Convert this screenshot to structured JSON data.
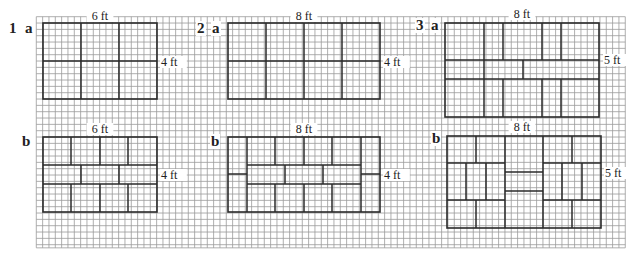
{
  "grid": {
    "x0": 36.3,
    "y0": 16.7,
    "cell": 6.333,
    "cols": 93,
    "rows": 36.5,
    "line_color": "#9a9a9a",
    "tile_color": "#2a2a2a"
  },
  "labels": [
    {
      "id": "q1",
      "text": "1",
      "x": 9,
      "y": 33,
      "cls": "num"
    },
    {
      "id": "q1a",
      "text": "a",
      "x": 25,
      "y": 33,
      "cls": "part"
    },
    {
      "id": "q1b",
      "text": "b",
      "x": 22,
      "y": 146,
      "cls": "part"
    },
    {
      "id": "q2",
      "text": "2",
      "x": 197,
      "y": 33,
      "cls": "num"
    },
    {
      "id": "q2a",
      "text": "a",
      "x": 212,
      "y": 33,
      "cls": "part"
    },
    {
      "id": "q2b",
      "text": "b",
      "x": 211,
      "y": 146,
      "cls": "part"
    },
    {
      "id": "q3",
      "text": "3",
      "x": 416,
      "y": 30,
      "cls": "num"
    },
    {
      "id": "q3a",
      "text": "a",
      "x": 431,
      "y": 30,
      "cls": "part"
    },
    {
      "id": "q3b",
      "text": "b",
      "x": 432,
      "y": 143,
      "cls": "part"
    }
  ],
  "dims": [
    {
      "id": "1a-width",
      "text": "6 ft",
      "x": 100,
      "y": 20,
      "anchor": "middle"
    },
    {
      "id": "1a-height",
      "text": "4 ft",
      "x": 161,
      "y": 66,
      "anchor": "start"
    },
    {
      "id": "1b-width",
      "text": "6 ft",
      "x": 100,
      "y": 133,
      "anchor": "middle"
    },
    {
      "id": "1b-height",
      "text": "4 ft",
      "x": 161,
      "y": 179,
      "anchor": "start"
    },
    {
      "id": "2a-width",
      "text": "8 ft",
      "x": 304,
      "y": 20,
      "anchor": "middle"
    },
    {
      "id": "2a-height",
      "text": "4 ft",
      "x": 384,
      "y": 66,
      "anchor": "start"
    },
    {
      "id": "2b-width",
      "text": "8 ft",
      "x": 304,
      "y": 133,
      "anchor": "middle"
    },
    {
      "id": "2b-height",
      "text": "4 ft",
      "x": 384,
      "y": 179,
      "anchor": "start"
    },
    {
      "id": "3a-width",
      "text": "8 ft",
      "x": 522,
      "y": 18,
      "anchor": "middle"
    },
    {
      "id": "3a-height",
      "text": "5 ft",
      "x": 604,
      "y": 64,
      "anchor": "start"
    },
    {
      "id": "3b-width",
      "text": "8 ft",
      "x": 522,
      "y": 131,
      "anchor": "middle"
    },
    {
      "id": "3b-height",
      "text": "5 ft",
      "x": 605,
      "y": 177,
      "anchor": "start"
    }
  ],
  "figures": [
    {
      "id": "1a",
      "outline": [
        43,
        23,
        157,
        99
      ],
      "lines": [
        [
          81,
          23,
          81,
          99
        ],
        [
          119,
          23,
          119,
          99
        ],
        [
          43,
          61,
          157,
          61
        ]
      ]
    },
    {
      "id": "1b",
      "outline": [
        43,
        137,
        157,
        212
      ],
      "lines": [
        [
          43,
          165,
          157,
          165
        ],
        [
          43,
          184,
          157,
          184
        ],
        [
          71,
          137,
          71,
          165
        ],
        [
          100,
          137,
          100,
          165
        ],
        [
          128,
          137,
          128,
          165
        ],
        [
          81,
          165,
          81,
          184
        ],
        [
          119,
          165,
          119,
          184
        ],
        [
          71,
          184,
          71,
          212
        ],
        [
          100,
          184,
          100,
          212
        ],
        [
          128,
          184,
          128,
          212
        ]
      ]
    },
    {
      "id": "2a",
      "outline": [
        228,
        23,
        380,
        99
      ],
      "lines": [
        [
          266,
          23,
          266,
          99
        ],
        [
          304,
          23,
          304,
          99
        ],
        [
          342,
          23,
          342,
          99
        ],
        [
          228,
          61,
          380,
          61
        ]
      ]
    },
    {
      "id": "2b",
      "outline": [
        228,
        137,
        380,
        212
      ],
      "lines": [
        [
          247,
          137,
          247,
          212
        ],
        [
          361,
          137,
          361,
          212
        ],
        [
          228,
          174,
          247,
          174
        ],
        [
          361,
          174,
          380,
          174
        ],
        [
          247,
          165,
          361,
          165
        ],
        [
          247,
          184,
          361,
          184
        ],
        [
          275,
          137,
          275,
          165
        ],
        [
          304,
          137,
          304,
          165
        ],
        [
          332,
          137,
          332,
          165
        ],
        [
          285,
          165,
          285,
          184
        ],
        [
          323,
          165,
          323,
          184
        ],
        [
          275,
          184,
          275,
          212
        ],
        [
          304,
          184,
          304,
          212
        ],
        [
          332,
          184,
          332,
          212
        ]
      ]
    },
    {
      "id": "3a",
      "outline": [
        445,
        23,
        599,
        117
      ],
      "lines": [
        [
          445,
          60,
          599,
          60
        ],
        [
          445,
          79,
          599,
          79
        ],
        [
          484,
          23,
          484,
          117
        ],
        [
          503,
          23,
          503,
          60
        ],
        [
          542,
          23,
          542,
          60
        ],
        [
          561,
          23,
          561,
          60
        ],
        [
          523,
          60,
          523,
          79
        ],
        [
          503,
          79,
          503,
          117
        ],
        [
          542,
          79,
          542,
          117
        ],
        [
          561,
          79,
          561,
          117
        ]
      ]
    },
    {
      "id": "3b",
      "outline": [
        447,
        136,
        601,
        228
      ],
      "lines": [
        [
          505,
          136,
          505,
          228
        ],
        [
          543,
          136,
          543,
          228
        ],
        [
          447,
          163,
          505,
          163
        ],
        [
          447,
          200,
          505,
          200
        ],
        [
          476,
          136,
          476,
          163
        ],
        [
          466,
          163,
          466,
          200
        ],
        [
          486,
          163,
          486,
          200
        ],
        [
          476,
          200,
          476,
          228
        ],
        [
          505,
          172,
          543,
          172
        ],
        [
          505,
          191,
          543,
          191
        ],
        [
          543,
          163,
          601,
          163
        ],
        [
          543,
          200,
          601,
          200
        ],
        [
          572,
          136,
          572,
          163
        ],
        [
          562,
          163,
          562,
          200
        ],
        [
          582,
          163,
          582,
          200
        ],
        [
          572,
          200,
          572,
          228
        ]
      ]
    }
  ]
}
